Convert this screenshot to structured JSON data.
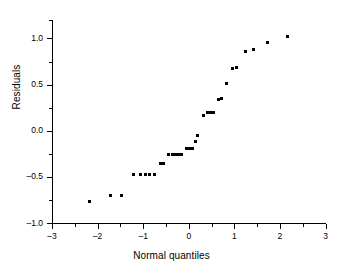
{
  "chart_data": {
    "type": "scatter",
    "title": "",
    "xlabel": "Normal quantiles",
    "ylabel": "Residuals",
    "xlim": [
      -3,
      3
    ],
    "ylim": [
      -1.0,
      1.2
    ],
    "grid": false,
    "legend": null,
    "x_ticks": [
      {
        "value": -3,
        "label": "–3",
        "major": true
      },
      {
        "value": -2.5,
        "label": "",
        "major": false
      },
      {
        "value": -2,
        "label": "–2",
        "major": true
      },
      {
        "value": -1.5,
        "label": "",
        "major": false
      },
      {
        "value": -1,
        "label": "–1",
        "major": true
      },
      {
        "value": -0.5,
        "label": "",
        "major": false
      },
      {
        "value": 0,
        "label": "0",
        "major": true
      },
      {
        "value": 0.5,
        "label": "",
        "major": false
      },
      {
        "value": 1,
        "label": "1",
        "major": true
      },
      {
        "value": 1.5,
        "label": "",
        "major": false
      },
      {
        "value": 2,
        "label": "2",
        "major": true
      },
      {
        "value": 2.5,
        "label": "",
        "major": false
      },
      {
        "value": 3,
        "label": "3",
        "major": true
      }
    ],
    "y_ticks": [
      {
        "value": 1.2,
        "label": "",
        "major": false
      },
      {
        "value": 1.0,
        "label": "1.0",
        "major": true
      },
      {
        "value": 0.75,
        "label": "",
        "major": false
      },
      {
        "value": 0.5,
        "label": "0.5",
        "major": true
      },
      {
        "value": 0.25,
        "label": "",
        "major": false
      },
      {
        "value": 0.0,
        "label": "0.0",
        "major": true
      },
      {
        "value": -0.25,
        "label": "",
        "major": false
      },
      {
        "value": -0.5,
        "label": "–0.5",
        "major": true
      },
      {
        "value": -0.75,
        "label": "",
        "major": false
      },
      {
        "value": -1.0,
        "label": "–1.0",
        "major": true
      }
    ],
    "marker": {
      "shape": "square",
      "size_px": 3,
      "color": "#000000"
    },
    "points": [
      {
        "x": -2.18,
        "y": -0.77
      },
      {
        "x": -1.72,
        "y": -0.7
      },
      {
        "x": -1.47,
        "y": -0.7
      },
      {
        "x": -1.21,
        "y": -0.47
      },
      {
        "x": -1.05,
        "y": -0.47
      },
      {
        "x": -0.95,
        "y": -0.47
      },
      {
        "x": -0.86,
        "y": -0.47
      },
      {
        "x": -0.76,
        "y": -0.47
      },
      {
        "x": -0.62,
        "y": -0.35
      },
      {
        "x": -0.56,
        "y": -0.35
      },
      {
        "x": -0.44,
        "y": -0.26
      },
      {
        "x": -0.36,
        "y": -0.26
      },
      {
        "x": -0.29,
        "y": -0.26
      },
      {
        "x": -0.22,
        "y": -0.26
      },
      {
        "x": -0.15,
        "y": -0.26
      },
      {
        "x": -0.04,
        "y": -0.19
      },
      {
        "x": 0.02,
        "y": -0.19
      },
      {
        "x": 0.08,
        "y": -0.19
      },
      {
        "x": 0.14,
        "y": -0.12
      },
      {
        "x": 0.2,
        "y": -0.05
      },
      {
        "x": 0.33,
        "y": 0.17
      },
      {
        "x": 0.42,
        "y": 0.2
      },
      {
        "x": 0.48,
        "y": 0.2
      },
      {
        "x": 0.54,
        "y": 0.2
      },
      {
        "x": 0.65,
        "y": 0.34
      },
      {
        "x": 0.72,
        "y": 0.35
      },
      {
        "x": 0.82,
        "y": 0.51
      },
      {
        "x": 0.95,
        "y": 0.67
      },
      {
        "x": 1.04,
        "y": 0.68
      },
      {
        "x": 1.25,
        "y": 0.86
      },
      {
        "x": 1.42,
        "y": 0.88
      },
      {
        "x": 1.72,
        "y": 0.96
      },
      {
        "x": 2.17,
        "y": 1.02
      }
    ]
  }
}
